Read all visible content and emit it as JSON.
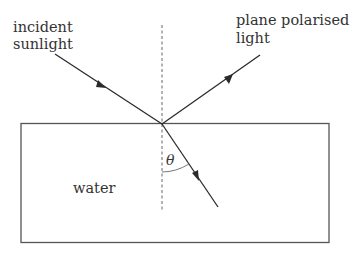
{
  "diagram": {
    "labels": {
      "incident_line1": "incident",
      "incident_line2": "sunlight",
      "reflected_line1": "plane polarised",
      "reflected_line2": "light",
      "medium": "water",
      "angle": "θ"
    },
    "colors": {
      "line": "#2b2b2b",
      "box": "#555555",
      "normal": "#666666",
      "text": "#333333"
    }
  }
}
